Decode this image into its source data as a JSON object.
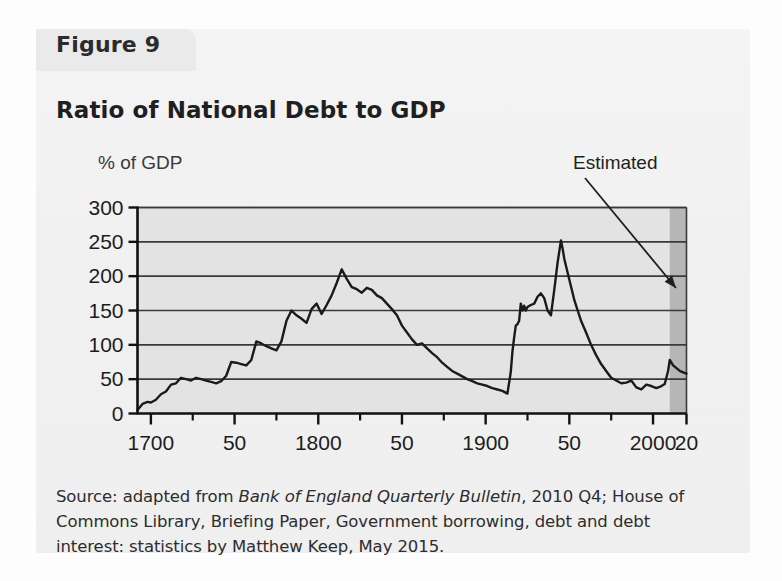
{
  "figure": {
    "tab_label": "Figure 9",
    "title": "Ratio of National Debt to GDP"
  },
  "annotations": {
    "estimated_label": "Estimated"
  },
  "source": {
    "prefix": "Source: adapted from ",
    "italic": "Bank of England Quarterly Bulletin",
    "suffix": ", 2010 Q4; House of Commons Library, Briefing Paper, Government borrowing, debt and debt interest: statistics by Matthew Keep, May 2015."
  },
  "colors": {
    "panel_background": "#f2f2f2",
    "plot_background": "#e3e3e3",
    "estimated_band": "#b6b6b6",
    "line": "#1a1a1a",
    "gridline": "#3a3a3a",
    "axis": "#111111",
    "text": "#1f1f1f"
  },
  "chart_data": {
    "type": "line",
    "title": "Ratio of National Debt to GDP",
    "xlabel": "",
    "ylabel": "% of GDP",
    "ylim": [
      0,
      300
    ],
    "xlim": [
      1692,
      2020
    ],
    "yticks": [
      0,
      50,
      100,
      150,
      200,
      250,
      300
    ],
    "ytick_labels": [
      "0",
      "50",
      "100",
      "150",
      "200",
      "250",
      "300"
    ],
    "xticks_major": [
      1700,
      1750,
      1800,
      1850,
      1900,
      1950,
      2000,
      2020
    ],
    "xtick_labels": [
      "1700",
      "50",
      "1800",
      "50",
      "1900",
      "50",
      "2000",
      "20"
    ],
    "xticks_minor": [
      1725,
      1775,
      1825,
      1875,
      1925,
      1975
    ],
    "grid": "horizontal",
    "legend": "none",
    "estimated_region": [
      2010,
      2020
    ],
    "series": [
      {
        "name": "National debt as % of GDP",
        "x": [
          1692,
          1695,
          1698,
          1700,
          1703,
          1706,
          1709,
          1712,
          1715,
          1718,
          1721,
          1724,
          1727,
          1730,
          1733,
          1736,
          1739,
          1742,
          1745,
          1748,
          1751,
          1754,
          1757,
          1760,
          1763,
          1766,
          1769,
          1772,
          1775,
          1778,
          1781,
          1784,
          1787,
          1790,
          1793,
          1796,
          1799,
          1802,
          1805,
          1808,
          1811,
          1814,
          1817,
          1820,
          1823,
          1826,
          1829,
          1832,
          1835,
          1838,
          1841,
          1844,
          1847,
          1850,
          1853,
          1856,
          1859,
          1862,
          1865,
          1868,
          1871,
          1874,
          1877,
          1880,
          1883,
          1886,
          1889,
          1892,
          1895,
          1898,
          1901,
          1904,
          1907,
          1910,
          1913,
          1915,
          1916,
          1917,
          1918,
          1919,
          1920,
          1921,
          1922,
          1923,
          1924,
          1925,
          1927,
          1929,
          1931,
          1933,
          1935,
          1937,
          1939,
          1941,
          1943,
          1945,
          1946,
          1947,
          1949,
          1951,
          1953,
          1955,
          1957,
          1960,
          1963,
          1966,
          1969,
          1972,
          1975,
          1978,
          1981,
          1984,
          1987,
          1990,
          1993,
          1996,
          1999,
          2002,
          2005,
          2007,
          2009,
          2010,
          2012,
          2014,
          2016,
          2018,
          2020
        ],
        "y": [
          5,
          14,
          17,
          16,
          20,
          28,
          32,
          42,
          44,
          52,
          50,
          48,
          52,
          50,
          48,
          46,
          44,
          47,
          55,
          75,
          74,
          72,
          70,
          78,
          105,
          102,
          98,
          95,
          92,
          105,
          135,
          150,
          143,
          138,
          132,
          152,
          160,
          145,
          158,
          172,
          190,
          210,
          196,
          184,
          181,
          176,
          183,
          180,
          172,
          168,
          160,
          152,
          143,
          128,
          118,
          108,
          100,
          102,
          95,
          88,
          82,
          74,
          68,
          62,
          58,
          54,
          50,
          47,
          44,
          42,
          40,
          37,
          35,
          33,
          29,
          60,
          90,
          110,
          128,
          130,
          135,
          160,
          150,
          157,
          150,
          155,
          158,
          160,
          170,
          175,
          168,
          150,
          143,
          180,
          220,
          252,
          240,
          225,
          205,
          185,
          165,
          150,
          135,
          118,
          100,
          85,
          72,
          62,
          52,
          48,
          44,
          45,
          48,
          38,
          35,
          42,
          40,
          37,
          40,
          43,
          62,
          78,
          70,
          66,
          62,
          60,
          58
        ]
      }
    ]
  }
}
